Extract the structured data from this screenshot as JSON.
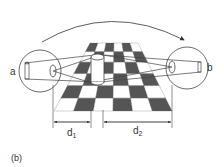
{
  "figure": {
    "panel_label": "(b)",
    "eye_left_label": "a",
    "eye_right_label": "b",
    "distance_1_label": "d",
    "distance_1_sub": "1",
    "distance_2_label": "d",
    "distance_2_sub": "2",
    "board": {
      "columns": 6,
      "rows": 6,
      "dark_color": "#555555",
      "light_color": "#ffffff"
    },
    "line_color": "#444444"
  }
}
